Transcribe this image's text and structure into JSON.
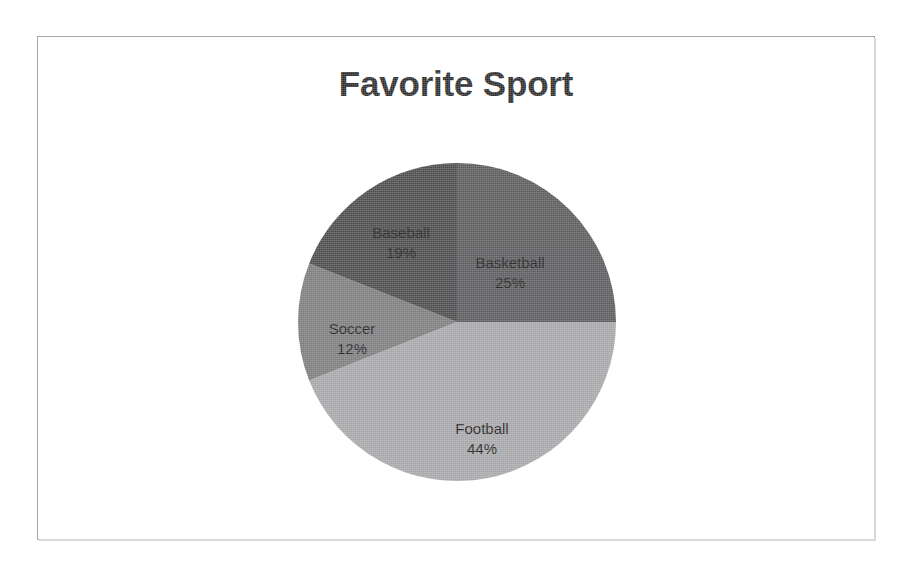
{
  "document": {
    "background_color": "#ffffff",
    "frame_border_color": "#a8a8a8"
  },
  "chart_data": {
    "type": "pie",
    "title": "Favorite Sport",
    "xlabel": "",
    "ylabel": "",
    "legend": "none",
    "label_format": "category + percentage inside slice",
    "start_angle_deg": 0,
    "direction": "clockwise",
    "categories": [
      "Basketball",
      "Football",
      "Soccer",
      "Baseball"
    ],
    "values": [
      25,
      44,
      12,
      19
    ],
    "slices": [
      {
        "name": "Basketball",
        "percent": 25,
        "percent_label": "25%",
        "color": "#59595b",
        "start_deg": 0,
        "end_deg": 90
      },
      {
        "name": "Football",
        "percent": 44,
        "percent_label": "44%",
        "color": "#a6a6a8",
        "start_deg": 90,
        "end_deg": 248.4
      },
      {
        "name": "Soccer",
        "percent": 12,
        "percent_label": "12%",
        "color": "#7b7b7d",
        "start_deg": 248.4,
        "end_deg": 291.6
      },
      {
        "name": "Baseball",
        "percent": 19,
        "percent_label": "19%",
        "color": "#4a4a4c",
        "start_deg": 291.6,
        "end_deg": 360
      }
    ],
    "total_percent": 100
  }
}
